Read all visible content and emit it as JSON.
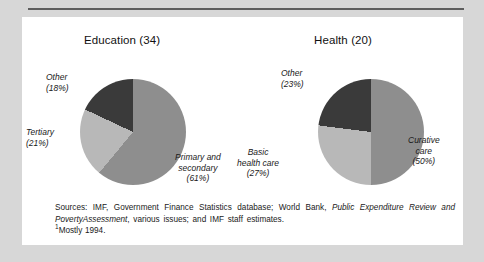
{
  "colors": {
    "page_background": "#d7d7d7",
    "card_background": "#ffffff",
    "rule": "#5d5d5d",
    "slice_dark": "#3a3a3a",
    "slice_medium": "#8e8e8e",
    "slice_light": "#b8b8b8",
    "text": "#1a1a1a"
  },
  "charts": {
    "education": {
      "title": "Education (34)",
      "labels": {
        "other": {
          "name": "Other",
          "pct": "(18%)"
        },
        "tertiary": {
          "name": "Tertiary",
          "pct": "(21%)"
        },
        "primary": {
          "name": "Primary and",
          "name2": "secondary",
          "pct": "(61%)"
        }
      }
    },
    "health": {
      "title": "Health (20)",
      "labels": {
        "other": {
          "name": "Other",
          "pct": "(23%)"
        },
        "basic": {
          "name": "Basic",
          "name2": "health care",
          "pct": "(27%)"
        },
        "curative": {
          "name": "Curative",
          "name2": "care",
          "pct": "(50%)"
        }
      }
    }
  },
  "notes": {
    "line1_a": "Sources: IMF, Government Finance Statistics database; World Bank, ",
    "line1_italic": "Public Expenditure Review and Poverty",
    "line2_italic": "Assessment",
    "line2_b": ", various issues; and IMF staff estimates.",
    "footnote_marker": "1",
    "footnote_text": "Mostly 1994."
  },
  "chart_data": [
    {
      "type": "pie",
      "title": "Education (34)",
      "categories": [
        "Primary and secondary",
        "Tertiary",
        "Other"
      ],
      "values": [
        61,
        21,
        18
      ],
      "units": "percent",
      "colors": [
        "#8e8e8e",
        "#b8b8b8",
        "#3a3a3a"
      ],
      "start_angle_deg": 0,
      "direction": "clockwise",
      "legend": "none",
      "grid": false,
      "annotations": [
        "Primary and secondary (61%)",
        "Tertiary (21%)",
        "Other (18%)"
      ]
    },
    {
      "type": "pie",
      "title": "Health (20)",
      "categories": [
        "Curative care",
        "Basic health care",
        "Other"
      ],
      "values": [
        50,
        27,
        23
      ],
      "units": "percent",
      "colors": [
        "#8e8e8e",
        "#b8b8b8",
        "#3a3a3a"
      ],
      "start_angle_deg": 0,
      "direction": "clockwise",
      "legend": "none",
      "grid": false,
      "annotations": [
        "Curative care (50%)",
        "Basic health care (27%)",
        "Other (23%)"
      ]
    }
  ]
}
